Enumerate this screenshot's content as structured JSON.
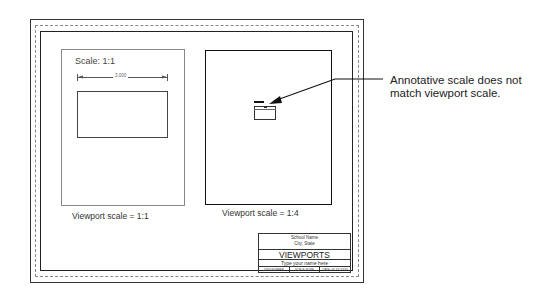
{
  "drawing": {
    "left_viewport": {
      "scale_label": "Scale: 1:1",
      "dimension_value": "3.000",
      "caption": "Viewport scale = 1:1"
    },
    "right_viewport": {
      "caption": "Viewport scale = 1:4"
    },
    "annotation": {
      "text": "Annotative scale does not match viewport scale."
    },
    "title_block": {
      "school_name": "School Name",
      "city_state": "City, State",
      "title": "VIEWPORTS",
      "name_field": "Type your name here",
      "cells": [
        "DWG NUMBER",
        "SCALE: NONE",
        "DATE: XX-XX-XXXX"
      ]
    },
    "colors": {
      "line": "#222222",
      "dashed_border": "#888888",
      "background": "#ffffff"
    }
  }
}
